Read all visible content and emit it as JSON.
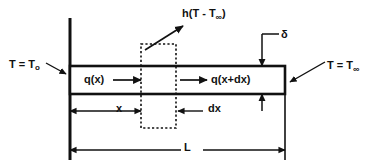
{
  "figure": {
    "type": "engineering-schematic",
    "width": 383,
    "height": 166,
    "background_color": "#ffffff",
    "line_color": "#111111"
  },
  "labels": {
    "convection": {
      "text_prefix": "h(T - T",
      "subscript": "∞",
      "text_suffix": ")",
      "full": "h(T - T∞)",
      "name": "convection-heat-flux"
    },
    "thickness": {
      "full": "δ",
      "name": "fin-thickness-delta"
    },
    "base_temp": {
      "text_prefix": "T = T",
      "subscript": "o",
      "full": "T = To",
      "name": "base-temperature"
    },
    "ambient_temp": {
      "text_prefix": "T = T",
      "subscript": "∞",
      "full": "T = T∞",
      "name": "ambient-temperature"
    },
    "heat_in": {
      "full": "q(x)",
      "name": "heat-flux-in"
    },
    "heat_out": {
      "full": "q(x+dx)",
      "name": "heat-flux-out"
    },
    "position": {
      "full": "x",
      "name": "position-dimension"
    },
    "element_width": {
      "full": "dx",
      "name": "element-width-dimension"
    },
    "length": {
      "full": "L",
      "name": "total-length-dimension"
    }
  },
  "geometry": {
    "bar_left": 70,
    "bar_right": 285,
    "bar_top": 66,
    "bar_bottom": 94,
    "wall_x": 70,
    "wall_top": 18,
    "wall_bottom": 160,
    "element_left": 141,
    "element_right": 176,
    "element_top": 44,
    "element_bottom": 128,
    "x_dim_y": 111,
    "l_dim_y": 150
  }
}
